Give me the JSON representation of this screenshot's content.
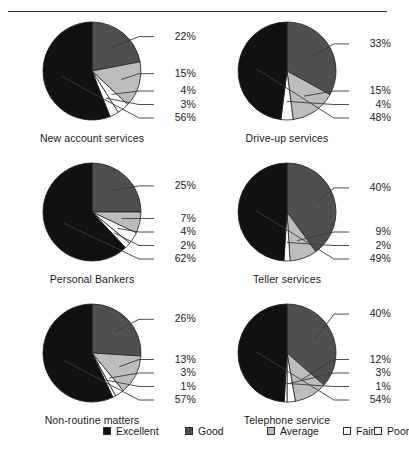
{
  "chart_data": {
    "type": "pie",
    "title": "",
    "legend_position": "bottom",
    "legend": [
      {
        "label": "Excellent",
        "color": "#111111"
      },
      {
        "label": "Good",
        "color": "#4f4f4f"
      },
      {
        "label": "Average",
        "color": "#bdbdbd"
      },
      {
        "label": "Fair",
        "color": "#ffffff"
      },
      {
        "label": "Poor",
        "color": "#ffffff"
      }
    ],
    "categories": [
      "Excellent",
      "Good",
      "Average",
      "Fair",
      "Poor"
    ],
    "charts": [
      {
        "title": "New account services",
        "labels": [
          "22%",
          "15%",
          "4%",
          "3%",
          "56%"
        ],
        "slices": [
          {
            "name": "Good",
            "value": 22,
            "label": "22%",
            "color": "#4f4f4f"
          },
          {
            "name": "Average",
            "value": 15,
            "label": "15%",
            "color": "#bdbdbd"
          },
          {
            "name": "Fair",
            "value": 4,
            "label": "4%",
            "color": "#ffffff"
          },
          {
            "name": "Poor",
            "value": 3,
            "label": "3%",
            "color": "#ffffff"
          },
          {
            "name": "Excellent",
            "value": 56,
            "label": "56%",
            "color": "#111111"
          }
        ]
      },
      {
        "title": "Drive-up services",
        "labels": [
          "33%",
          "15%",
          "4%",
          "48%"
        ],
        "slices": [
          {
            "name": "Good",
            "value": 33,
            "label": "33%",
            "color": "#4f4f4f"
          },
          {
            "name": "Average",
            "value": 15,
            "label": "15%",
            "color": "#bdbdbd"
          },
          {
            "name": "Fair",
            "value": 4,
            "label": "4%",
            "color": "#ffffff"
          },
          {
            "name": "Excellent",
            "value": 48,
            "label": "48%",
            "color": "#111111"
          }
        ]
      },
      {
        "title": "Personal Bankers",
        "labels": [
          "25%",
          "7%",
          "4%",
          "2%",
          "62%"
        ],
        "slices": [
          {
            "name": "Good",
            "value": 25,
            "label": "25%",
            "color": "#4f4f4f"
          },
          {
            "name": "Average",
            "value": 7,
            "label": "7%",
            "color": "#bdbdbd"
          },
          {
            "name": "Fair",
            "value": 4,
            "label": "4%",
            "color": "#ffffff"
          },
          {
            "name": "Poor",
            "value": 2,
            "label": "2%",
            "color": "#ffffff"
          },
          {
            "name": "Excellent",
            "value": 62,
            "label": "62%",
            "color": "#111111"
          }
        ]
      },
      {
        "title": "Teller services",
        "labels": [
          "40%",
          "9%",
          "2%",
          "49%"
        ],
        "slices": [
          {
            "name": "Good",
            "value": 40,
            "label": "40%",
            "color": "#4f4f4f"
          },
          {
            "name": "Average",
            "value": 9,
            "label": "9%",
            "color": "#bdbdbd"
          },
          {
            "name": "Fair",
            "value": 2,
            "label": "2%",
            "color": "#ffffff"
          },
          {
            "name": "Excellent",
            "value": 49,
            "label": "49%",
            "color": "#111111"
          }
        ]
      },
      {
        "title": "Non-routine matters",
        "labels": [
          "26%",
          "13%",
          "3%",
          "1%",
          "57%"
        ],
        "slices": [
          {
            "name": "Good",
            "value": 26,
            "label": "26%",
            "color": "#4f4f4f"
          },
          {
            "name": "Average",
            "value": 13,
            "label": "13%",
            "color": "#bdbdbd"
          },
          {
            "name": "Fair",
            "value": 3,
            "label": "3%",
            "color": "#ffffff"
          },
          {
            "name": "Poor",
            "value": 1,
            "label": "1%",
            "color": "#ffffff"
          },
          {
            "name": "Excellent",
            "value": 57,
            "label": "57%",
            "color": "#111111"
          }
        ]
      },
      {
        "title": "Telephone service",
        "labels": [
          "40%",
          "12%",
          "3%",
          "1%",
          "54%"
        ],
        "slices": [
          {
            "name": "Good",
            "value": 40,
            "label": "40%",
            "color": "#4f4f4f"
          },
          {
            "name": "Average",
            "value": 12,
            "label": "12%",
            "color": "#bdbdbd"
          },
          {
            "name": "Fair",
            "value": 3,
            "label": "3%",
            "color": "#ffffff"
          },
          {
            "name": "Poor",
            "value": 1,
            "label": "1%",
            "color": "#ffffff"
          },
          {
            "name": "Excellent",
            "value": 54,
            "label": "54%",
            "color": "#111111"
          }
        ]
      }
    ]
  }
}
